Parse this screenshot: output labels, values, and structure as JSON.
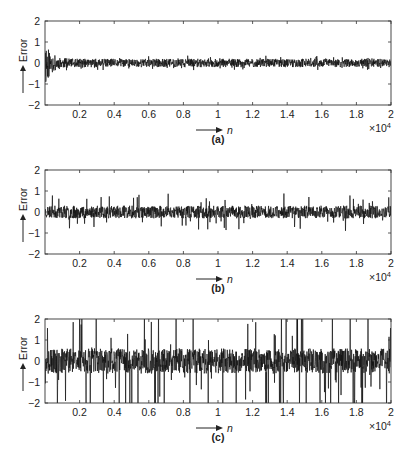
{
  "chart_data": [
    {
      "type": "line",
      "panel_label": "(a)",
      "title": "",
      "xlabel": "n",
      "ylabel": "Error",
      "x_multiplier": "×10^4",
      "xlim": [
        0,
        20000
      ],
      "ylim": [
        -2,
        2
      ],
      "xticks": [
        0.2,
        0.4,
        0.6,
        0.8,
        1,
        1.2,
        1.4,
        1.6,
        1.8,
        2
      ],
      "yticks": [
        -2,
        -1,
        0,
        1,
        2
      ],
      "grid": false,
      "description": "Error signal with initial transient up to about ±1.2 near n=0, decaying quickly to a steady band of about ±0.2 for the rest of the range",
      "envelope": {
        "initial_amplitude": 1.2,
        "decay_n": 1000,
        "steady_amplitude": 0.2,
        "peak_amplitude": 0.35
      },
      "seed": 11
    },
    {
      "type": "line",
      "panel_label": "(b)",
      "title": "",
      "xlabel": "n",
      "ylabel": "Error",
      "x_multiplier": "×10^4",
      "xlim": [
        0,
        20000
      ],
      "ylim": [
        -2,
        2
      ],
      "xticks": [
        0.2,
        0.4,
        0.6,
        0.8,
        1,
        1.2,
        1.4,
        1.6,
        1.8,
        2
      ],
      "yticks": [
        -2,
        -1,
        0,
        1,
        2
      ],
      "grid": false,
      "description": "Stationary error noise, dense band about ±0.3 with occasional spikes to about ±0.9",
      "envelope": {
        "initial_amplitude": 0.3,
        "decay_n": 0,
        "steady_amplitude": 0.3,
        "peak_amplitude": 0.9
      },
      "seed": 23
    },
    {
      "type": "line",
      "panel_label": "(c)",
      "title": "",
      "xlabel": "n",
      "ylabel": "Error",
      "x_multiplier": "×10^4",
      "xlim": [
        0,
        20000
      ],
      "ylim": [
        -2,
        2
      ],
      "xticks": [
        0.2,
        0.4,
        0.6,
        0.8,
        1,
        1.2,
        1.4,
        1.6,
        1.8,
        2
      ],
      "yticks": [
        -2,
        -1,
        0,
        1,
        2
      ],
      "grid": false,
      "description": "Heavy-tailed error noise, dense band about ±0.6 with many spikes exceeding ±2 (clipped at axes limits)",
      "envelope": {
        "initial_amplitude": 0.6,
        "decay_n": 0,
        "steady_amplitude": 0.6,
        "peak_amplitude": 2.5
      },
      "seed": 37
    }
  ],
  "labels": {
    "ylabel": "Error",
    "xlabel": "n",
    "multiplier_base": "×10",
    "multiplier_exp": "4",
    "panels": [
      "(a)",
      "(b)",
      "(c)"
    ]
  },
  "colors": {
    "trace": "#111111",
    "axes": "#333333",
    "background": "#ffffff"
  }
}
